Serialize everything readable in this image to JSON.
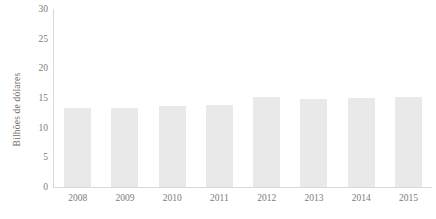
{
  "chart_data": {
    "type": "bar",
    "title": "",
    "subtitle": "",
    "xlabel": "",
    "ylabel": "Bilhões de dólares",
    "categories": [
      "2008",
      "2009",
      "2010",
      "2011",
      "2012",
      "2013",
      "2014",
      "2015"
    ],
    "values": [
      13.3,
      13.4,
      13.6,
      13.8,
      15.2,
      14.9,
      15.0,
      15.2
    ],
    "ylim": [
      0,
      30
    ],
    "yticks": [
      0,
      5,
      10,
      15,
      20,
      25,
      30
    ],
    "ytick_labels": [
      "0",
      "5",
      "10",
      "15",
      "20",
      "25",
      "30"
    ],
    "grid": false,
    "legend": null,
    "legend_position": "none",
    "series": [
      {
        "name": "Bilhões de dólares",
        "values": [
          13.3,
          13.4,
          13.6,
          13.8,
          15.2,
          14.9,
          15.0,
          15.2
        ]
      }
    ],
    "colors": {
      "bar_fill": "#e9e9e9",
      "axis_line": "#d9d9d9",
      "tick_text": "#7b7b7b",
      "axis_title_text": "#6f6f6f",
      "background": "#ffffff"
    }
  }
}
